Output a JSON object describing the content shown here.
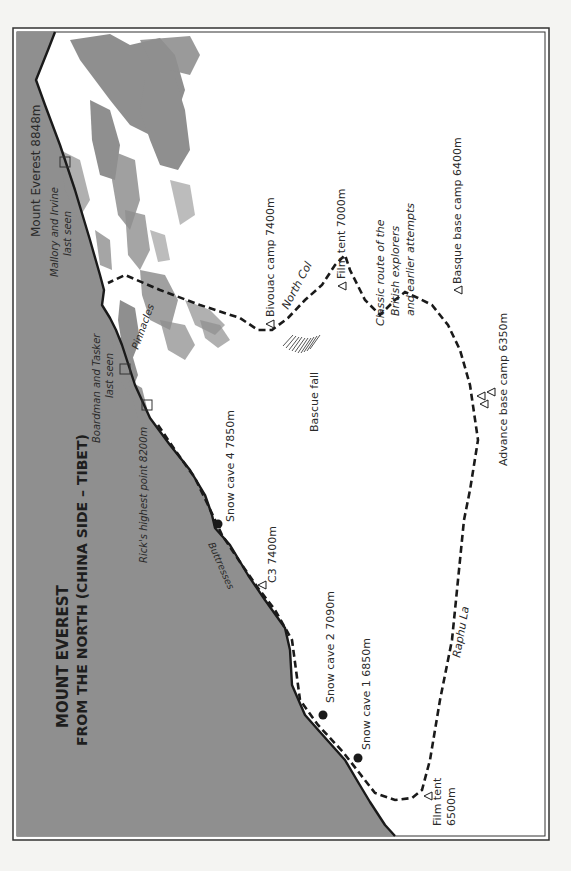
{
  "map": {
    "title_line1": "MOUNT EVEREST",
    "title_line2": "FROM THE NORTH (CHINA SIDE – TIBET)",
    "colors": {
      "terrain": "#8f8f8f",
      "snow": "#ffffff",
      "ink": "#1a1a1a",
      "paper": "#f4f4f2"
    },
    "summit": {
      "label": "Mount Everest 8848m"
    },
    "features": {
      "north_col": "North Col",
      "pinnacles": "Pinnacles",
      "buttresses": "Buttresses",
      "raphu_la": "Raphu La",
      "bascue_fall": "Bascue fall"
    },
    "last_seen": {
      "mallory_line1": "Mallory and Irvine",
      "mallory_line2": "last seen",
      "boardman_line1": "Boardman and Tasker",
      "boardman_line2": "last seen",
      "rick": "Rick's highest point 8200m"
    },
    "classic_route": {
      "line1": "Classic route of the",
      "line2": "British explorers",
      "line3": "and earlier attempts"
    },
    "camps": {
      "bivouac": "Bivouac camp 7400m",
      "film_tent_7000": "Film tent 7000m",
      "basque_base": "Basque base camp 6400m",
      "advance_base": "Advance base camp 6350m",
      "snow_cave_4": "Snow cave 4 7850m",
      "c3": "C3 7400m",
      "snow_cave_2": "Snow cave 2 7090m",
      "snow_cave_1": "Snow cave 1 6850m",
      "film_tent_6500_line1": "Film tent",
      "film_tent_6500_line2": "6500m"
    },
    "legend_symbols": {
      "triangle": "camp-triangle",
      "dot": "snow-cave-dot",
      "square": "last-seen-square"
    }
  }
}
